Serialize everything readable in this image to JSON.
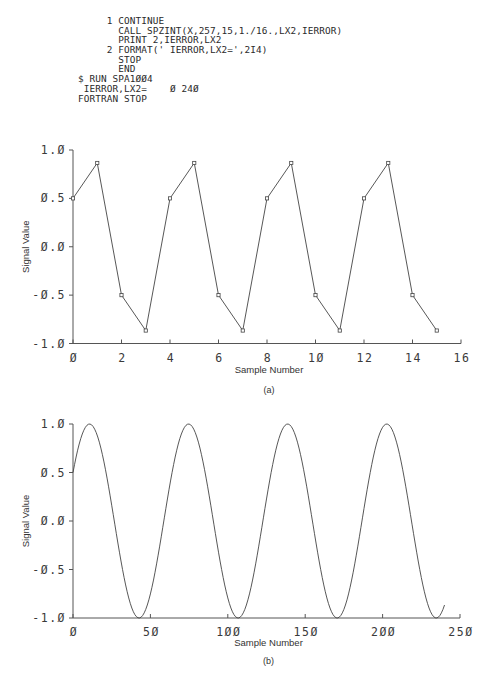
{
  "listing": {
    "lines": [
      "     1 CONTINUE",
      "       CALL SPZINT(X,257,15,1./16.,LX2,IERROR)",
      "       PRINT 2,IERROR,LX2",
      "     2 FORMAT(' IERROR,LX2=',2I4)",
      "       STOP",
      "       END",
      "$ RUN SPA1ØØ4",
      " IERROR,LX2=    Ø 24Ø",
      "FORTRAN STOP"
    ]
  },
  "chart_data": [
    {
      "id": "a",
      "type": "line",
      "markers": "square",
      "caption": "(a)",
      "title": "",
      "xlabel": "Sample Number",
      "ylabel": "Signal Value",
      "xlim": [
        0,
        16
      ],
      "ylim": [
        -1.0,
        1.0
      ],
      "xticks": [
        0,
        2,
        4,
        6,
        8,
        10,
        12,
        14,
        16
      ],
      "xtick_labels": [
        "Ø",
        "2",
        "4",
        "6",
        "8",
        "1Ø",
        "12",
        "14",
        "16"
      ],
      "yticks": [
        1.0,
        0.5,
        0.0,
        -0.5,
        -1.0
      ],
      "ytick_labels": [
        "1.Ø",
        "Ø.5",
        "Ø.Ø",
        "-Ø.5",
        "-1.Ø"
      ],
      "grid": false,
      "x": [
        0,
        1,
        2,
        3,
        4,
        5,
        6,
        7,
        8,
        9,
        10,
        11,
        12,
        13,
        14,
        15
      ],
      "values": [
        0.5,
        0.866,
        -0.5,
        -0.866,
        0.5,
        0.866,
        -0.5,
        -0.866,
        0.5,
        0.866,
        -0.5,
        -0.866,
        0.5,
        0.866,
        -0.5,
        -0.866
      ]
    },
    {
      "id": "b",
      "type": "line",
      "markers": "none",
      "caption": "(b)",
      "title": "",
      "xlabel": "Sample Number",
      "ylabel": "Signal Value",
      "xlim": [
        0,
        250
      ],
      "ylim": [
        -1.0,
        1.0
      ],
      "xticks": [
        0,
        50,
        100,
        150,
        200,
        250
      ],
      "xtick_labels": [
        "Ø",
        "5Ø",
        "1ØØ",
        "15Ø",
        "2ØØ",
        "25Ø"
      ],
      "yticks": [
        1.0,
        0.5,
        0.0,
        -0.5,
        -1.0
      ],
      "ytick_labels": [
        "1.Ø",
        "Ø.5",
        "Ø.Ø",
        "-Ø.5",
        "-1.Ø"
      ],
      "grid": false,
      "description": "Interpolated signal x(n) = sin(2*pi*n/64 + pi/6), n = 0..240 (LX2 = 240 samples)",
      "n_points": 241,
      "period": 64,
      "phase": 0.5236,
      "peaks_at": [
        11,
        75,
        139,
        203
      ],
      "troughs_at": [
        43,
        107,
        171,
        235
      ]
    }
  ]
}
